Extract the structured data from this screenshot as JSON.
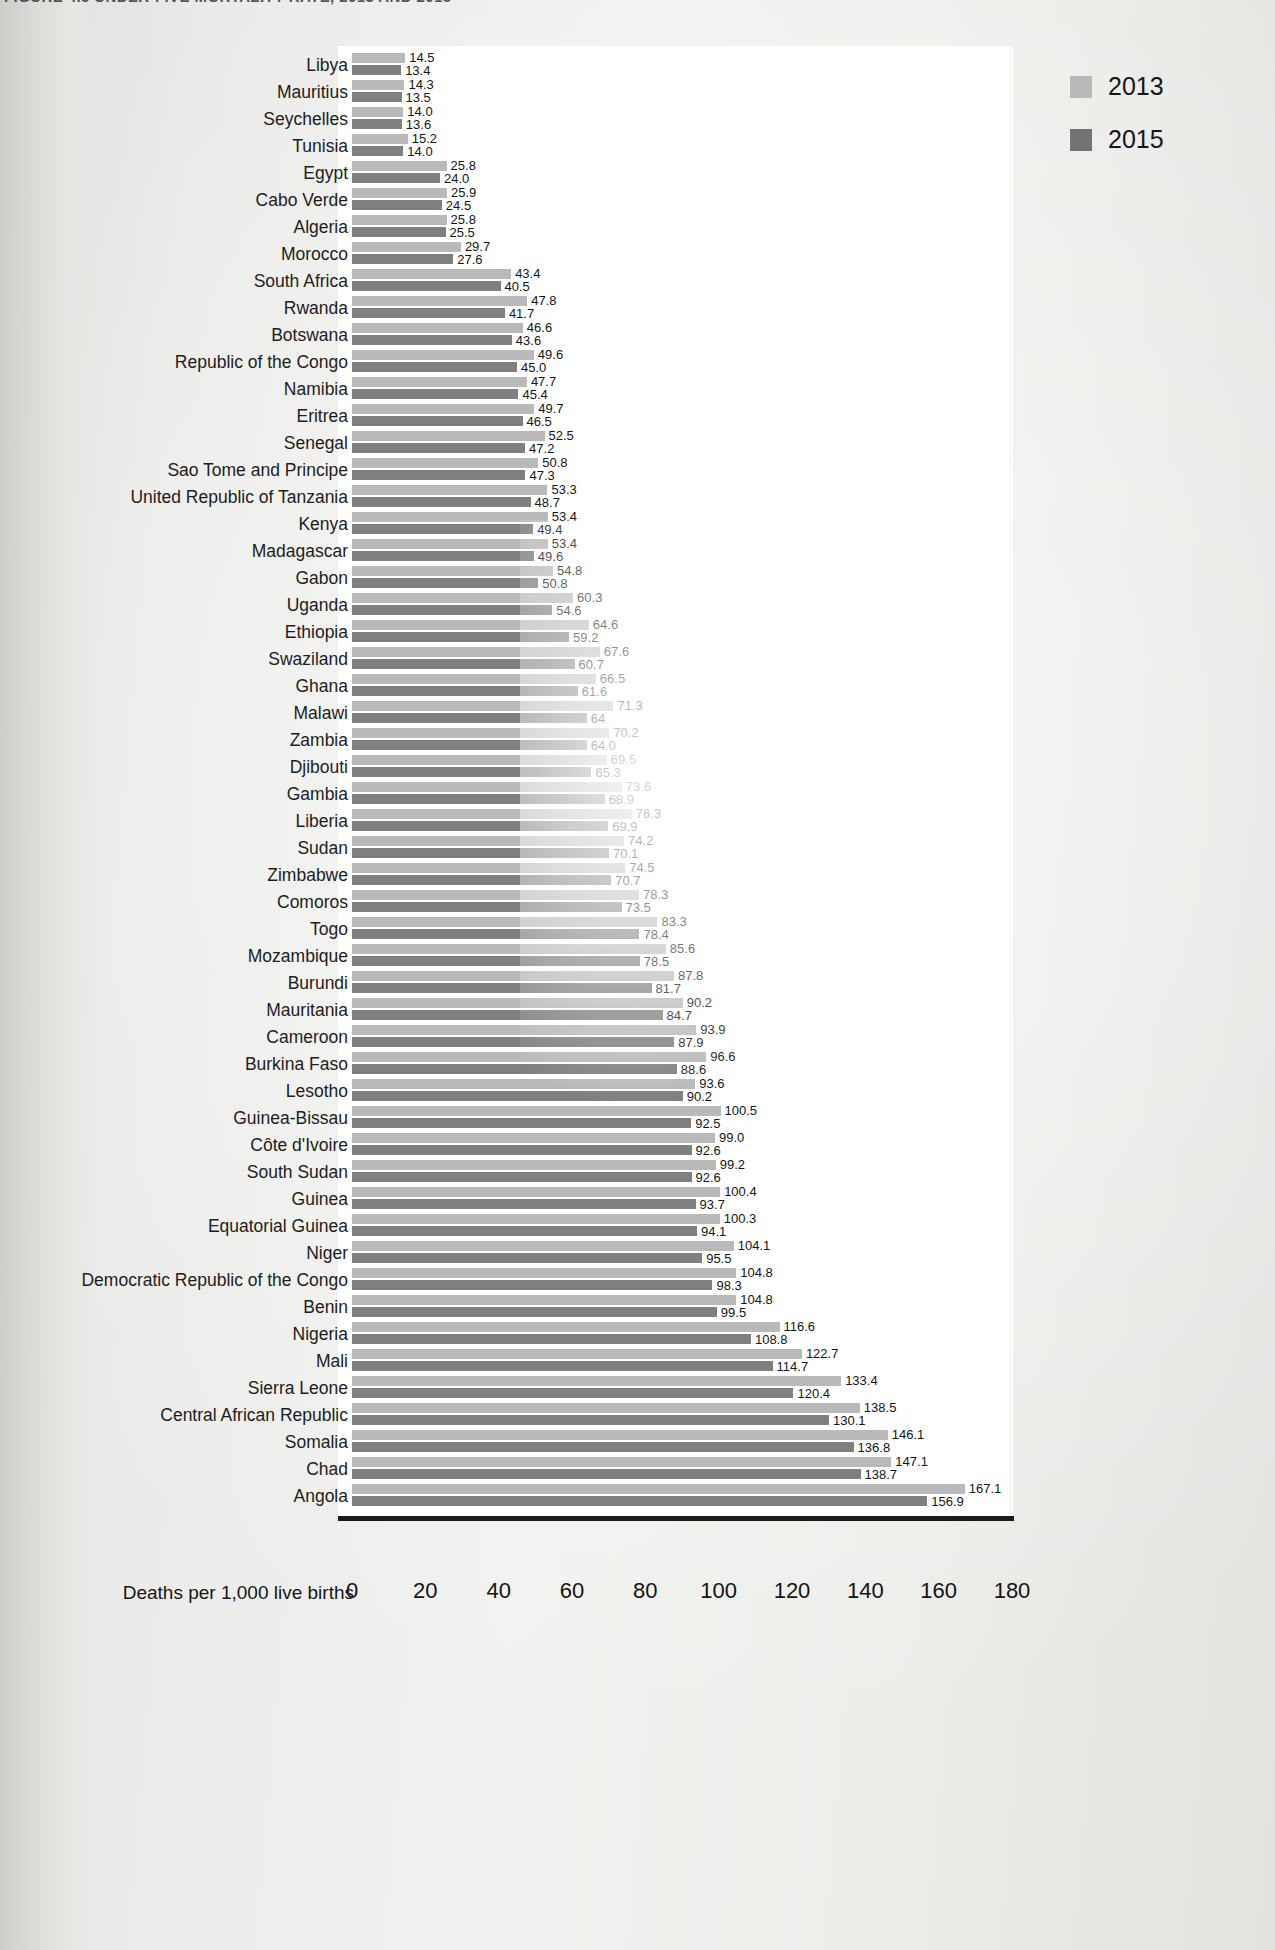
{
  "figure": {
    "title_partial": "FIGURE 4.5   UNDER-FIVE MORTALITY RATE, 2013 AND 2015"
  },
  "legend": {
    "position": "top-right",
    "items": [
      {
        "label": "2013",
        "color": "#b9b9b9"
      },
      {
        "label": "2015",
        "color": "#737373"
      }
    ]
  },
  "axis": {
    "x_title": "Deaths per 1,000 live births",
    "ticks": [
      "0",
      "20",
      "40",
      "60",
      "80",
      "100",
      "120",
      "140",
      "160",
      "180"
    ]
  },
  "chart_data": {
    "type": "bar",
    "orientation": "horizontal",
    "title": "FIGURE 4.5   UNDER-FIVE MORTALITY RATE, 2013 AND 2015",
    "xlabel": "Deaths per 1,000 live births",
    "ylabel": "",
    "xlim": [
      0,
      180
    ],
    "xticks": [
      0,
      20,
      40,
      60,
      80,
      100,
      120,
      140,
      160,
      180
    ],
    "grid": true,
    "legend_position": "top-right",
    "categories": [
      "Libya",
      "Mauritius",
      "Seychelles",
      "Tunisia",
      "Egypt",
      "Cabo Verde",
      "Algeria",
      "Morocco",
      "South Africa",
      "Rwanda",
      "Botswana",
      "Republic of the Congo",
      "Namibia",
      "Eritrea",
      "Senegal",
      "Sao Tome and Principe",
      "United Republic of Tanzania",
      "Kenya",
      "Madagascar",
      "Gabon",
      "Uganda",
      "Ethiopia",
      "Swaziland",
      "Ghana",
      "Malawi",
      "Zambia",
      "Djibouti",
      "Gambia",
      "Liberia",
      "Sudan",
      "Zimbabwe",
      "Comoros",
      "Togo",
      "Mozambique",
      "Burundi",
      "Mauritania",
      "Cameroon",
      "Burkina Faso",
      "Lesotho",
      "Guinea-Bissau",
      "Côte d'Ivoire",
      "South Sudan",
      "Guinea",
      "Equatorial Guinea",
      "Niger",
      "Democratic Republic of the Congo",
      "Benin",
      "Nigeria",
      "Mali",
      "Sierra Leone",
      "Central African Republic",
      "Somalia",
      "Chad",
      "Angola"
    ],
    "series": [
      {
        "name": "2013",
        "color": "#b9b9b9",
        "values": [
          14.5,
          14.3,
          14.0,
          15.2,
          25.8,
          25.9,
          25.8,
          29.7,
          43.4,
          47.8,
          46.6,
          49.6,
          47.7,
          49.7,
          52.5,
          50.8,
          53.3,
          53.4,
          53.4,
          54.8,
          60.3,
          64.6,
          67.6,
          66.5,
          71.3,
          70.2,
          69.5,
          73.6,
          76.3,
          74.2,
          74.5,
          78.3,
          83.3,
          85.6,
          87.8,
          90.2,
          93.9,
          96.6,
          93.6,
          100.5,
          99.0,
          99.2,
          100.4,
          100.3,
          104.1,
          104.8,
          104.8,
          116.6,
          122.7,
          133.4,
          138.5,
          146.1,
          147.1,
          167.1
        ],
        "labels": [
          "14.5",
          "14.3",
          "14.0",
          "15.2",
          "25.8",
          "25.9",
          "25.8",
          "29.7",
          "43.4",
          "47.8",
          "46.6",
          "49.6",
          "47.7",
          "49.7",
          "52.5",
          "50.8",
          "53.3",
          "53.4",
          "53.4",
          "54.8",
          "60.3",
          "64.6",
          "67.6",
          "66.5",
          "71.3",
          "70.2",
          "69.5",
          "73.6",
          "76.3",
          "74.2",
          "74.5",
          "78.3",
          "83.3",
          "85.6",
          "87.8",
          "90.2",
          "93.9",
          "96.6",
          "93.6",
          "100.5",
          "99.0",
          "99.2",
          "100.4",
          "100.3",
          "104.1",
          "104.8",
          "104.8",
          "116.6",
          "122.7",
          "133.4",
          "138.5",
          "146.1",
          "147.1",
          "167.1"
        ]
      },
      {
        "name": "2015",
        "color": "#7f7f7f",
        "values": [
          13.4,
          13.5,
          13.6,
          14.0,
          24.0,
          24.5,
          25.5,
          27.6,
          40.5,
          41.7,
          43.6,
          45.0,
          45.4,
          46.5,
          47.2,
          47.3,
          48.7,
          49.4,
          49.6,
          50.8,
          54.6,
          59.2,
          60.7,
          61.6,
          64.0,
          64.0,
          65.3,
          68.9,
          69.9,
          70.1,
          70.7,
          73.5,
          78.4,
          78.5,
          81.7,
          84.7,
          87.9,
          88.6,
          90.2,
          92.5,
          92.6,
          92.6,
          93.7,
          94.1,
          95.5,
          98.3,
          99.5,
          108.8,
          114.7,
          120.4,
          130.1,
          136.8,
          138.7,
          156.9
        ],
        "labels": [
          "13.4",
          "13.5",
          "13.6",
          "14.0",
          "24.0",
          "24.5",
          "25.5",
          "27.6",
          "40.5",
          "41.7",
          "43.6",
          "45.0",
          "45.4",
          "46.5",
          "47.2",
          "47.3",
          "48.7",
          "49.4",
          "49.6",
          "50.8",
          "54.6",
          "59.2",
          "60.7",
          "61.6",
          "64",
          "64.0",
          "65.3",
          "68.9",
          "69.9",
          "70.1",
          "70.7",
          "73.5",
          "78.4",
          "78.5",
          "81.7",
          "84.7",
          "87.9",
          "88.6",
          "90.2",
          "92.5",
          "92.6",
          "92.6",
          "93.7",
          "94.1",
          "95.5",
          "98.3",
          "99.5",
          "108.8",
          "114.7",
          "120.4",
          "130.1",
          "136.8",
          "138.7",
          "156.9"
        ]
      }
    ]
  }
}
